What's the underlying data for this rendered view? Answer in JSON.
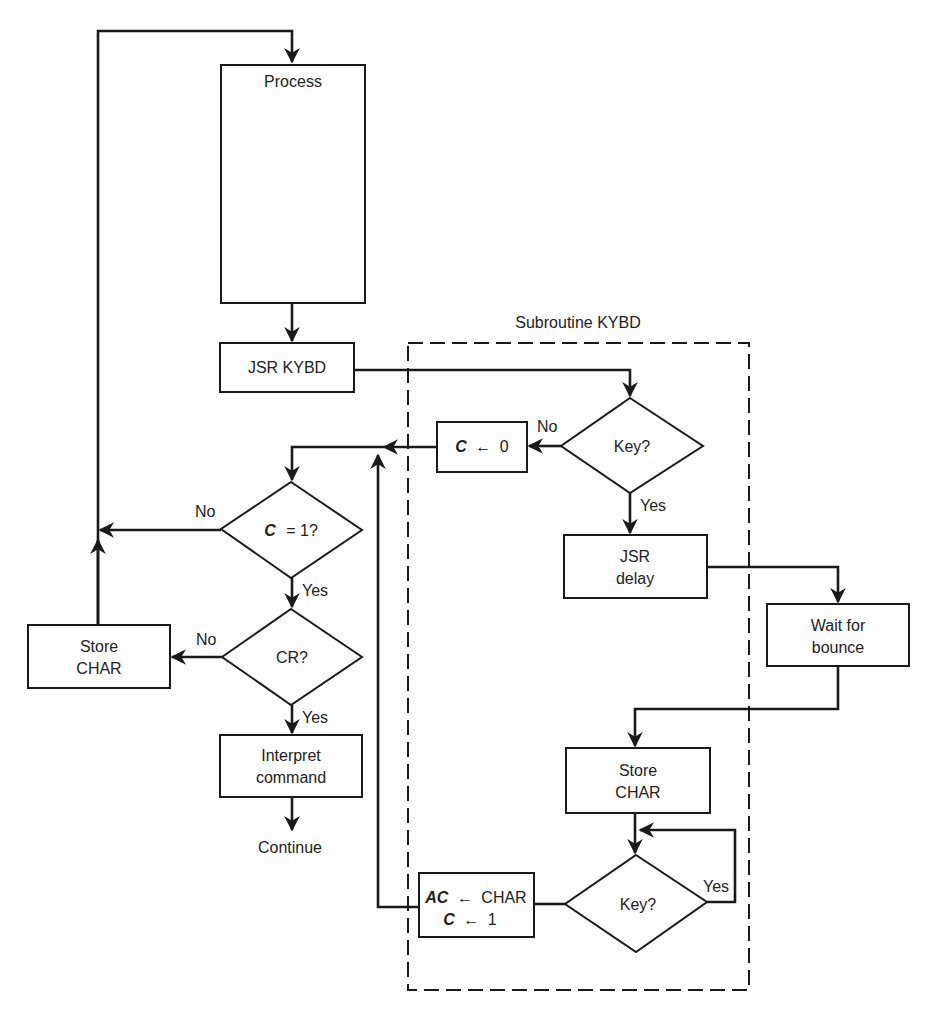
{
  "diagram": {
    "type": "flowchart",
    "title": "Subroutine KYBD",
    "nodes": {
      "process": {
        "label": "Process"
      },
      "jsr_kybd": {
        "label": "JSR KYBD"
      },
      "key1": {
        "label": "Key?"
      },
      "c_zero": {
        "var": "C",
        "op": "←",
        "val": "0"
      },
      "c_eq_1": {
        "var": "C",
        "rest": "=  1?"
      },
      "cr": {
        "label": "CR?"
      },
      "store_char_left": {
        "line1": "Store",
        "line2": "CHAR"
      },
      "interpret": {
        "line1": "Interpret",
        "line2": "command"
      },
      "continue": {
        "label": "Continue"
      },
      "jsr_delay": {
        "line1": "JSR",
        "line2": "delay"
      },
      "wait": {
        "line1": "Wait for",
        "line2": "bounce"
      },
      "store_char_right": {
        "line1": "Store",
        "line2": "CHAR"
      },
      "key2": {
        "label": "Key?"
      },
      "ac_assign": {
        "var1": "AC",
        "op1": "←",
        "val1": "CHAR",
        "var2": "C",
        "op2": "←",
        "val2": "1"
      }
    },
    "edge_labels": {
      "key1_no": "No",
      "key1_yes": "Yes",
      "c1_no": "No",
      "c1_yes": "Yes",
      "cr_no": "No",
      "cr_yes": "Yes",
      "key2_yes": "Yes"
    }
  }
}
